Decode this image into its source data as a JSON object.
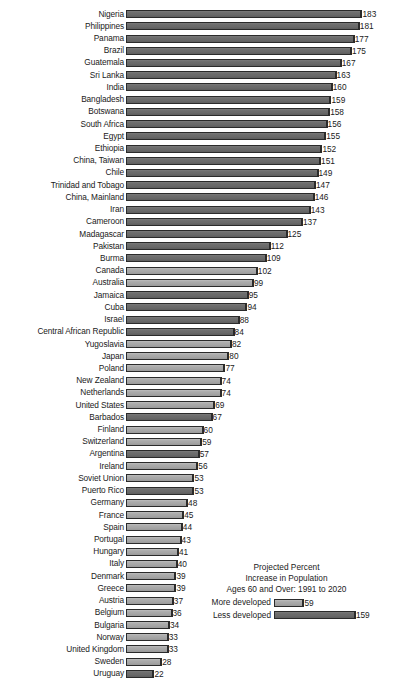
{
  "chart_data": {
    "type": "bar",
    "orientation": "horizontal",
    "title": "Projected Percent Increase in Population Ages 60 and Over:  1991 to 2020",
    "title_lines": [
      "Projected Percent",
      "Increase in Population",
      "Ages 60 and Over:  1991 to 2020"
    ],
    "xlabel": "",
    "ylabel": "",
    "xlim": [
      0,
      183
    ],
    "grid": false,
    "legend_position": "bottom-right",
    "legend": [
      {
        "label": "More developed",
        "value": 59,
        "group": "more-developed",
        "color": "#a6a6a6"
      },
      {
        "label": "Less developed",
        "value": 159,
        "group": "less-developed",
        "color": "#6a6a6a"
      }
    ],
    "series_colors": {
      "less_developed": "#6a6a6a",
      "more_developed": "#a6a6a6",
      "bar_outline": "#2b2b2b",
      "background": "#ffffff",
      "text": "#1a1a1a"
    },
    "categories": [
      "Nigeria",
      "Philippines",
      "Panama",
      "Brazil",
      "Guatemala",
      "Sri Lanka",
      "India",
      "Bangladesh",
      "Botswana",
      "South Africa",
      "Egypt",
      "Ethiopia",
      "China, Taiwan",
      "Chile",
      "Trinidad and Tobago",
      "China, Mainland",
      "Iran",
      "Cameroon",
      "Madagascar",
      "Pakistan",
      "Burma",
      "Canada",
      "Australia",
      "Jamaica",
      "Cuba",
      "Israel",
      "Central African Republic",
      "Yugoslavia",
      "Japan",
      "Poland",
      "New Zealand",
      "Netherlands",
      "United States",
      "Barbados",
      "Finland",
      "Switzerland",
      "Argentina",
      "Ireland",
      "Soviet Union",
      "Puerto Rico",
      "Germany",
      "France",
      "Spain",
      "Portugal",
      "Hungary",
      "Italy",
      "Denmark",
      "Greece",
      "Austria",
      "Belgium",
      "Bulgaria",
      "Norway",
      "United Kingdom",
      "Sweden",
      "Uruguay"
    ],
    "values": [
      183,
      181,
      177,
      175,
      167,
      163,
      160,
      159,
      158,
      156,
      155,
      152,
      151,
      149,
      147,
      146,
      143,
      137,
      125,
      112,
      109,
      102,
      99,
      95,
      94,
      88,
      84,
      82,
      80,
      77,
      74,
      74,
      69,
      67,
      60,
      59,
      57,
      56,
      53,
      53,
      48,
      45,
      44,
      43,
      41,
      40,
      39,
      39,
      37,
      36,
      34,
      33,
      33,
      28,
      22
    ],
    "groups": [
      "less-developed",
      "less-developed",
      "less-developed",
      "less-developed",
      "less-developed",
      "less-developed",
      "less-developed",
      "less-developed",
      "less-developed",
      "less-developed",
      "less-developed",
      "less-developed",
      "less-developed",
      "less-developed",
      "less-developed",
      "less-developed",
      "less-developed",
      "less-developed",
      "less-developed",
      "less-developed",
      "less-developed",
      "more-developed",
      "more-developed",
      "less-developed",
      "less-developed",
      "less-developed",
      "less-developed",
      "more-developed",
      "more-developed",
      "more-developed",
      "more-developed",
      "more-developed",
      "more-developed",
      "less-developed",
      "more-developed",
      "more-developed",
      "less-developed",
      "more-developed",
      "more-developed",
      "less-developed",
      "more-developed",
      "more-developed",
      "more-developed",
      "more-developed",
      "more-developed",
      "more-developed",
      "more-developed",
      "more-developed",
      "more-developed",
      "more-developed",
      "more-developed",
      "more-developed",
      "more-developed",
      "more-developed",
      "less-developed"
    ]
  }
}
